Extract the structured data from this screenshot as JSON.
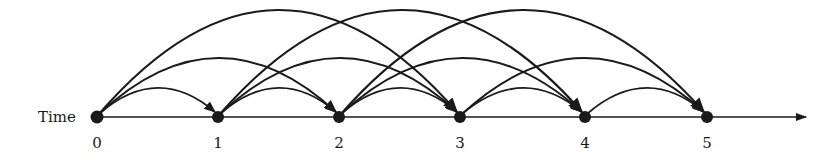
{
  "diagram": {
    "axis_label": "Time",
    "nodes": [
      {
        "label": "0",
        "x": 97
      },
      {
        "label": "1",
        "x": 218
      },
      {
        "label": "2",
        "x": 339
      },
      {
        "label": "3",
        "x": 460
      },
      {
        "label": "4",
        "x": 585
      },
      {
        "label": "5",
        "x": 707
      }
    ],
    "baseline_y": 117,
    "axis_end_x": 806,
    "edges": [
      {
        "from": 0,
        "to": 1
      },
      {
        "from": 0,
        "to": 2
      },
      {
        "from": 0,
        "to": 3
      },
      {
        "from": 1,
        "to": 2
      },
      {
        "from": 1,
        "to": 3
      },
      {
        "from": 1,
        "to": 4
      },
      {
        "from": 2,
        "to": 3
      },
      {
        "from": 2,
        "to": 4
      },
      {
        "from": 2,
        "to": 5
      },
      {
        "from": 3,
        "to": 4
      },
      {
        "from": 3,
        "to": 5
      },
      {
        "from": 4,
        "to": 5
      }
    ],
    "arc_peak_by_span": {
      "1": 90,
      "2": 60,
      "3": 12
    },
    "stroke_color": "#1a1a1a"
  }
}
